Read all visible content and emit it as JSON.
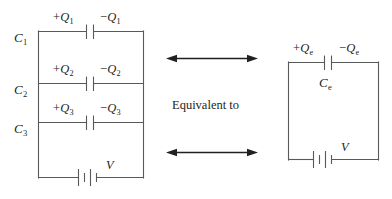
{
  "figure": {
    "background_color": "#ffffff",
    "line_color": "#58595b",
    "arrow_color": "#231f20",
    "text_color": "#231f20",
    "center_text": "Equivalent to"
  },
  "left_circuit": {
    "name": "three-parallel-capacitors",
    "branches": [
      {
        "capacitor_label": "C",
        "capacitor_sub": "1",
        "positive_charge_sign": "+",
        "positive_charge_symbol": "Q",
        "positive_charge_sub": "1",
        "negative_charge_sign": "−",
        "negative_charge_symbol": "Q",
        "negative_charge_sub": "1"
      },
      {
        "capacitor_label": "C",
        "capacitor_sub": "2",
        "positive_charge_sign": "+",
        "positive_charge_symbol": "Q",
        "positive_charge_sub": "2",
        "negative_charge_sign": "−",
        "negative_charge_symbol": "Q",
        "negative_charge_sub": "2"
      },
      {
        "capacitor_label": "C",
        "capacitor_sub": "3",
        "positive_charge_sign": "+",
        "positive_charge_symbol": "Q",
        "positive_charge_sub": "3",
        "negative_charge_sign": "−",
        "negative_charge_symbol": "Q",
        "negative_charge_sub": "3"
      }
    ],
    "battery_label": "V"
  },
  "right_circuit": {
    "name": "equivalent-single-capacitor",
    "capacitor_label": "C",
    "capacitor_sub": "e",
    "positive_charge_sign": "+",
    "positive_charge_symbol": "Q",
    "positive_charge_sub": "e",
    "negative_charge_sign": "−",
    "negative_charge_symbol": "Q",
    "negative_charge_sub": "e",
    "battery_label": "V"
  },
  "arrows": [
    {
      "name": "top-equivalence-arrow",
      "direction": "double"
    },
    {
      "name": "bottom-equivalence-arrow",
      "direction": "double"
    }
  ]
}
